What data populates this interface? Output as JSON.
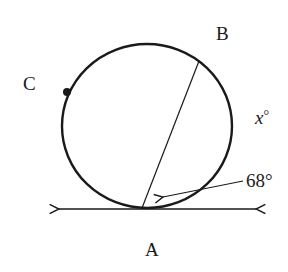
{
  "diagram": {
    "type": "circle-tangent-chord",
    "labels": {
      "A": "A",
      "B": "B",
      "C": "C",
      "x_angle": "x°",
      "given_angle": "68°"
    },
    "x_var": "x",
    "x_deg": "°",
    "colors": {
      "stroke": "#1a1a1a",
      "background": "#ffffff"
    }
  }
}
